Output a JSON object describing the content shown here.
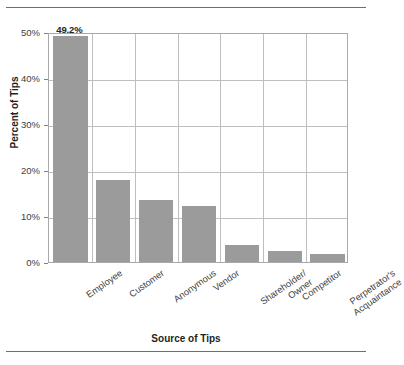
{
  "chart_data": {
    "type": "bar",
    "title": "",
    "xlabel": "Source of Tips",
    "ylabel": "Percent of Tips",
    "ylim": [
      0,
      50
    ],
    "yticks": [
      "0%",
      "10%",
      "20%",
      "30%",
      "40%",
      "50%"
    ],
    "ytick_values": [
      0,
      10,
      20,
      30,
      40,
      50
    ],
    "grid": "both",
    "legend": "none",
    "bar_color": "#9b9b9b",
    "categories": [
      "Employee",
      "Customer",
      "Anonymous",
      "Vendor",
      "Shareholder/ Owner",
      "Competitor",
      "Perpetrator's Acquaintance"
    ],
    "category_lines": [
      [
        "Employee"
      ],
      [
        "Customer"
      ],
      [
        "Anonymous"
      ],
      [
        "Vendor"
      ],
      [
        "Shareholder/",
        "Owner"
      ],
      [
        "Competitor"
      ],
      [
        "Perpetrator's",
        "Acquaintance"
      ]
    ],
    "values": [
      49.2,
      17.8,
      13.4,
      12.1,
      3.7,
      2.5,
      1.8
    ],
    "data_labels": [
      "49.2%",
      "17.8%",
      "13.4%",
      "12.1%",
      "3.7%",
      "2.5%",
      "1.8%"
    ]
  }
}
